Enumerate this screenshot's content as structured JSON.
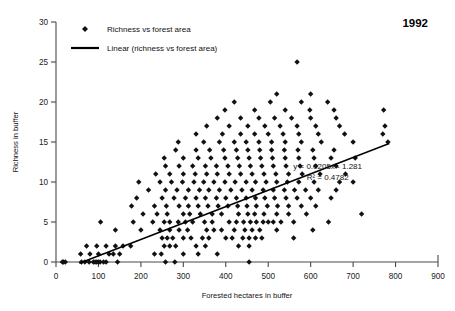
{
  "chart_data": {
    "type": "scatter",
    "title": "1992",
    "xlabel": "Forested hectares in buffer",
    "ylabel": "Richness in buffer",
    "xlim": [
      0,
      900
    ],
    "ylim": [
      0,
      30
    ],
    "xticks": [
      0,
      100,
      200,
      300,
      400,
      500,
      600,
      700,
      800,
      900
    ],
    "yticks": [
      0,
      5,
      10,
      15,
      20,
      25,
      30
    ],
    "grid": false,
    "legend_position": "top-left",
    "legend": [
      {
        "label": "Richness vs forest area",
        "marker": "diamond",
        "color": "#111111"
      },
      {
        "label": "Linear (richness vs forest area)",
        "marker": "line",
        "color": "#000000"
      }
    ],
    "annotations": [
      {
        "text": "y = 0.0205x - 1.281",
        "x": 640,
        "y": 11.6
      },
      {
        "text": "R² = 0.4782",
        "x": 640,
        "y": 10.2
      }
    ],
    "fit": {
      "slope": 0.0205,
      "intercept": -1.281,
      "r2": 0.4782,
      "x_start": 55,
      "x_end": 785,
      "equation": "y = 0.0205x - 1.281",
      "r2_label": "R² = 0.4782"
    },
    "series": [
      {
        "name": "Richness vs forest area",
        "points": [
          [
            15,
            0
          ],
          [
            18,
            0
          ],
          [
            22,
            0
          ],
          [
            60,
            0
          ],
          [
            68,
            0
          ],
          [
            78,
            0
          ],
          [
            88,
            0
          ],
          [
            92,
            0
          ],
          [
            96,
            0
          ],
          [
            100,
            0
          ],
          [
            104,
            0
          ],
          [
            112,
            0
          ],
          [
            118,
            0
          ],
          [
            145,
            0
          ],
          [
            258,
            0
          ],
          [
            280,
            0
          ],
          [
            455,
            0
          ],
          [
            58,
            1
          ],
          [
            80,
            1
          ],
          [
            100,
            1
          ],
          [
            125,
            1
          ],
          [
            135,
            1
          ],
          [
            150,
            1
          ],
          [
            232,
            1
          ],
          [
            248,
            1
          ],
          [
            300,
            1
          ],
          [
            335,
            1
          ],
          [
            380,
            1
          ],
          [
            72,
            2
          ],
          [
            96,
            2
          ],
          [
            118,
            2
          ],
          [
            140,
            2
          ],
          [
            158,
            2
          ],
          [
            176,
            2
          ],
          [
            255,
            2
          ],
          [
            268,
            2
          ],
          [
            282,
            2
          ],
          [
            330,
            2
          ],
          [
            352,
            2
          ],
          [
            430,
            2
          ],
          [
            455,
            2
          ],
          [
            250,
            3
          ],
          [
            262,
            3
          ],
          [
            275,
            3
          ],
          [
            300,
            3
          ],
          [
            318,
            3
          ],
          [
            345,
            3
          ],
          [
            360,
            3
          ],
          [
            400,
            3
          ],
          [
            415,
            3
          ],
          [
            440,
            3
          ],
          [
            455,
            3
          ],
          [
            470,
            3
          ],
          [
            485,
            3
          ],
          [
            560,
            3
          ],
          [
            140,
            4
          ],
          [
            200,
            4
          ],
          [
            245,
            4
          ],
          [
            268,
            4
          ],
          [
            290,
            4
          ],
          [
            310,
            4
          ],
          [
            355,
            4
          ],
          [
            372,
            4
          ],
          [
            390,
            4
          ],
          [
            420,
            4
          ],
          [
            445,
            4
          ],
          [
            462,
            4
          ],
          [
            480,
            4
          ],
          [
            520,
            4
          ],
          [
            605,
            4
          ],
          [
            105,
            5
          ],
          [
            182,
            5
          ],
          [
            228,
            5
          ],
          [
            255,
            5
          ],
          [
            268,
            5
          ],
          [
            288,
            5
          ],
          [
            305,
            5
          ],
          [
            322,
            5
          ],
          [
            350,
            5
          ],
          [
            368,
            5
          ],
          [
            408,
            5
          ],
          [
            425,
            5
          ],
          [
            442,
            5
          ],
          [
            458,
            5
          ],
          [
            472,
            5
          ],
          [
            488,
            5
          ],
          [
            500,
            5
          ],
          [
            512,
            5
          ],
          [
            530,
            5
          ],
          [
            560,
            5
          ],
          [
            642,
            5
          ],
          [
            205,
            6
          ],
          [
            238,
            6
          ],
          [
            262,
            6
          ],
          [
            300,
            6
          ],
          [
            315,
            6
          ],
          [
            340,
            6
          ],
          [
            368,
            6
          ],
          [
            390,
            6
          ],
          [
            430,
            6
          ],
          [
            452,
            6
          ],
          [
            468,
            6
          ],
          [
            490,
            6
          ],
          [
            520,
            6
          ],
          [
            548,
            6
          ],
          [
            590,
            6
          ],
          [
            720,
            6
          ],
          [
            178,
            7
          ],
          [
            232,
            7
          ],
          [
            260,
            7
          ],
          [
            290,
            7
          ],
          [
            312,
            7
          ],
          [
            335,
            7
          ],
          [
            358,
            7
          ],
          [
            382,
            7
          ],
          [
            405,
            7
          ],
          [
            428,
            7
          ],
          [
            450,
            7
          ],
          [
            472,
            7
          ],
          [
            498,
            7
          ],
          [
            522,
            7
          ],
          [
            548,
            7
          ],
          [
            578,
            7
          ],
          [
            612,
            7
          ],
          [
            190,
            8
          ],
          [
            250,
            8
          ],
          [
            278,
            8
          ],
          [
            305,
            8
          ],
          [
            330,
            8
          ],
          [
            352,
            8
          ],
          [
            378,
            8
          ],
          [
            400,
            8
          ],
          [
            425,
            8
          ],
          [
            448,
            8
          ],
          [
            470,
            8
          ],
          [
            492,
            8
          ],
          [
            515,
            8
          ],
          [
            542,
            8
          ],
          [
            568,
            8
          ],
          [
            600,
            8
          ],
          [
            648,
            8
          ],
          [
            218,
            9
          ],
          [
            258,
            9
          ],
          [
            285,
            9
          ],
          [
            312,
            9
          ],
          [
            338,
            9
          ],
          [
            360,
            9
          ],
          [
            385,
            9
          ],
          [
            412,
            9
          ],
          [
            438,
            9
          ],
          [
            462,
            9
          ],
          [
            488,
            9
          ],
          [
            512,
            9
          ],
          [
            538,
            9
          ],
          [
            562,
            9
          ],
          [
            588,
            9
          ],
          [
            618,
            9
          ],
          [
            660,
            9
          ],
          [
            195,
            10
          ],
          [
            245,
            10
          ],
          [
            272,
            10
          ],
          [
            298,
            10
          ],
          [
            325,
            10
          ],
          [
            348,
            10
          ],
          [
            372,
            10
          ],
          [
            398,
            10
          ],
          [
            422,
            10
          ],
          [
            448,
            10
          ],
          [
            470,
            10
          ],
          [
            495,
            10
          ],
          [
            520,
            10
          ],
          [
            545,
            10
          ],
          [
            572,
            10
          ],
          [
            608,
            10
          ],
          [
            668,
            10
          ],
          [
            700,
            10
          ],
          [
            235,
            11
          ],
          [
            268,
            11
          ],
          [
            300,
            11
          ],
          [
            328,
            11
          ],
          [
            355,
            11
          ],
          [
            380,
            11
          ],
          [
            408,
            11
          ],
          [
            435,
            11
          ],
          [
            462,
            11
          ],
          [
            490,
            11
          ],
          [
            518,
            11
          ],
          [
            548,
            11
          ],
          [
            580,
            11
          ],
          [
            622,
            11
          ],
          [
            682,
            11
          ],
          [
            258,
            12
          ],
          [
            290,
            12
          ],
          [
            322,
            12
          ],
          [
            352,
            12
          ],
          [
            378,
            12
          ],
          [
            405,
            12
          ],
          [
            432,
            12
          ],
          [
            458,
            12
          ],
          [
            485,
            12
          ],
          [
            512,
            12
          ],
          [
            542,
            12
          ],
          [
            575,
            12
          ],
          [
            612,
            12
          ],
          [
            660,
            12
          ],
          [
            255,
            13
          ],
          [
            300,
            13
          ],
          [
            335,
            13
          ],
          [
            365,
            13
          ],
          [
            398,
            13
          ],
          [
            428,
            13
          ],
          [
            455,
            13
          ],
          [
            482,
            13
          ],
          [
            510,
            13
          ],
          [
            540,
            13
          ],
          [
            572,
            13
          ],
          [
            608,
            13
          ],
          [
            648,
            13
          ],
          [
            705,
            13
          ],
          [
            282,
            14
          ],
          [
            330,
            14
          ],
          [
            362,
            14
          ],
          [
            395,
            14
          ],
          [
            425,
            14
          ],
          [
            452,
            14
          ],
          [
            480,
            14
          ],
          [
            508,
            14
          ],
          [
            538,
            14
          ],
          [
            570,
            14
          ],
          [
            605,
            14
          ],
          [
            655,
            14
          ],
          [
            288,
            15
          ],
          [
            348,
            15
          ],
          [
            385,
            15
          ],
          [
            420,
            15
          ],
          [
            448,
            15
          ],
          [
            478,
            15
          ],
          [
            508,
            15
          ],
          [
            540,
            15
          ],
          [
            578,
            15
          ],
          [
            625,
            15
          ],
          [
            700,
            15
          ],
          [
            782,
            15
          ],
          [
            330,
            16
          ],
          [
            392,
            16
          ],
          [
            435,
            16
          ],
          [
            468,
            16
          ],
          [
            500,
            16
          ],
          [
            535,
            16
          ],
          [
            572,
            16
          ],
          [
            618,
            16
          ],
          [
            680,
            16
          ],
          [
            770,
            16
          ],
          [
            355,
            17
          ],
          [
            408,
            17
          ],
          [
            452,
            17
          ],
          [
            492,
            17
          ],
          [
            528,
            17
          ],
          [
            568,
            17
          ],
          [
            612,
            17
          ],
          [
            668,
            17
          ],
          [
            775,
            17
          ],
          [
            380,
            18
          ],
          [
            435,
            18
          ],
          [
            478,
            18
          ],
          [
            515,
            18
          ],
          [
            555,
            18
          ],
          [
            600,
            18
          ],
          [
            660,
            18
          ],
          [
            398,
            19
          ],
          [
            468,
            19
          ],
          [
            540,
            19
          ],
          [
            598,
            19
          ],
          [
            655,
            19
          ],
          [
            772,
            19
          ],
          [
            420,
            20
          ],
          [
            505,
            20
          ],
          [
            578,
            20
          ],
          [
            640,
            20
          ],
          [
            520,
            21
          ],
          [
            600,
            21
          ],
          [
            568,
            25
          ]
        ]
      }
    ]
  }
}
